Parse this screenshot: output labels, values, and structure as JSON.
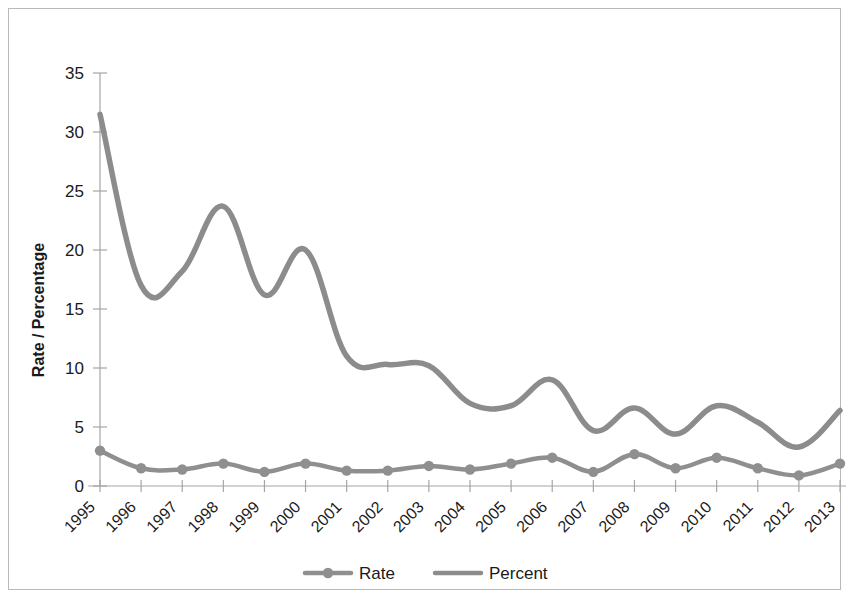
{
  "chart_data": {
    "type": "line",
    "title": "",
    "xlabel": "",
    "ylabel": "Rate / Percentage",
    "ylim": [
      0,
      35
    ],
    "y_ticks": [
      0,
      5,
      10,
      15,
      20,
      25,
      30,
      35
    ],
    "grid": false,
    "legend_position": "bottom",
    "smoothing": "spline",
    "categories": [
      "1995",
      "1996",
      "1997",
      "1998",
      "1999",
      "2000",
      "2001",
      "2002",
      "2003",
      "2004",
      "2005",
      "2006",
      "2007",
      "2008",
      "2009",
      "2010",
      "2011",
      "2012",
      "2013"
    ],
    "series": [
      {
        "name": "Rate",
        "marker": "circle",
        "color": "#8f8f8f",
        "values": [
          3.0,
          1.5,
          1.4,
          1.9,
          1.2,
          1.9,
          1.3,
          1.3,
          1.7,
          1.4,
          1.9,
          2.4,
          1.2,
          2.7,
          1.5,
          2.4,
          1.5,
          0.9,
          1.9
        ]
      },
      {
        "name": "Percent",
        "marker": "none",
        "color": "#8c8c8c",
        "values": [
          31.5,
          17.0,
          18.2,
          23.7,
          16.2,
          20.0,
          11.0,
          10.3,
          10.2,
          7.0,
          6.8,
          9.0,
          4.7,
          6.6,
          4.4,
          6.8,
          5.4,
          3.3,
          6.4
        ]
      }
    ]
  },
  "axis": {
    "y_title": "Rate / Percentage",
    "y_tick_labels": [
      "0",
      "5",
      "10",
      "15",
      "20",
      "25",
      "30",
      "35"
    ],
    "x_tick_labels": [
      "1995",
      "1996",
      "1997",
      "1998",
      "1999",
      "2000",
      "2001",
      "2002",
      "2003",
      "2004",
      "2005",
      "2006",
      "2007",
      "2008",
      "2009",
      "2010",
      "2011",
      "2012",
      "2013"
    ]
  },
  "legend": {
    "items": [
      {
        "label": "Rate",
        "color": "#8f8f8f",
        "marker": "circle"
      },
      {
        "label": "Percent",
        "color": "#8c8c8c",
        "marker": "none"
      }
    ]
  },
  "colors": {
    "rate": "#8f8f8f",
    "percent": "#8c8c8c",
    "axis": "#a5a5a5",
    "text": "#1a1a1a",
    "border": "#b9b9b9",
    "background": "#ffffff"
  }
}
